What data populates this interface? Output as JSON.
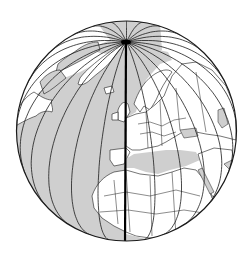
{
  "map": {
    "title": "Orthographic globe centred on the prime meridian",
    "projection": "orthographic",
    "view_center_lat": 36,
    "view_center_lon": 0,
    "globe": {
      "cx": 126.5,
      "cy": 131,
      "r": 110
    },
    "meridian_step_deg": 15,
    "meridians_deg": [
      -90,
      -75,
      -60,
      -45,
      -30,
      -15,
      15,
      30,
      45,
      60,
      75,
      90,
      105,
      -105,
      120,
      -120,
      135,
      -135,
      150,
      -150,
      165,
      -165,
      180
    ],
    "highlighted_meridian_deg": 0,
    "colors": {
      "ocean_west": "#cfcfcf",
      "land": "#ffffff",
      "sea_east": "#cfcfcf",
      "polar_cap": "#cfcfcf",
      "lines": "#1a1a1a",
      "background": "#ffffff"
    },
    "regions_visible": [
      "Greenland",
      "Canadian Arctic",
      "Iceland",
      "Europe",
      "North Africa",
      "Middle East",
      "Atlantic Ocean",
      "Mediterranean Sea"
    ]
  }
}
